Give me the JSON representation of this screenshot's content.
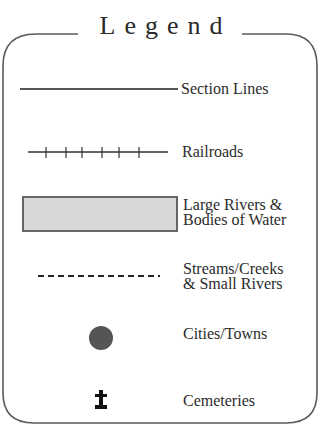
{
  "legend": {
    "title": "Legend",
    "items": [
      {
        "id": "section-lines",
        "symbol": "solid-line",
        "label_lines": [
          "Section Lines"
        ]
      },
      {
        "id": "railroads",
        "symbol": "railroad-line",
        "label_lines": [
          "Railroads"
        ]
      },
      {
        "id": "large-rivers",
        "symbol": "shaded-rectangle",
        "label_lines": [
          "Large Rivers &",
          "Bodies of Water"
        ]
      },
      {
        "id": "streams",
        "symbol": "dashed-line",
        "label_lines": [
          "Streams/Creeks",
          "& Small Rivers"
        ]
      },
      {
        "id": "cities",
        "symbol": "filled-circle",
        "label_lines": [
          "Cities/Towns"
        ]
      },
      {
        "id": "cemeteries",
        "symbol": "grave-cross",
        "label_lines": [
          "Cemeteries"
        ]
      }
    ]
  },
  "colors": {
    "border": "#555555",
    "line": "#4a4a4a",
    "water_fill": "#d6d6d6",
    "water_border": "#6a6a6a",
    "city_fill": "#555555",
    "cemetery": "#111111",
    "text": "#2b2b2b"
  }
}
